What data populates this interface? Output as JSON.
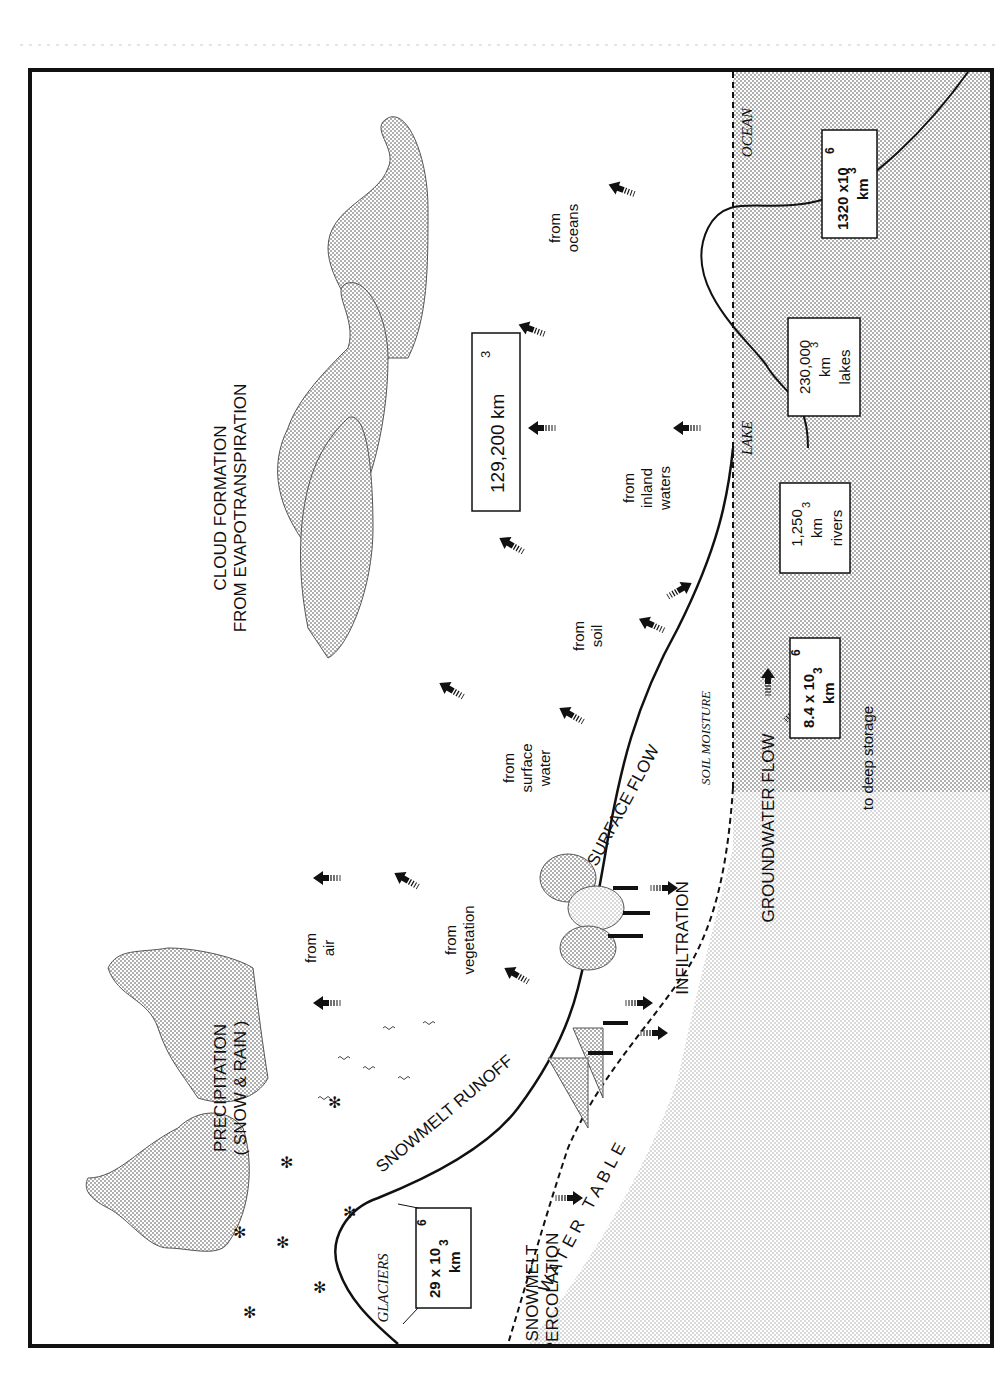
{
  "figure": {
    "title_lines": [
      "CLOUD FORMATION",
      "FROM EVAPOTRANSPIRATION"
    ],
    "precipitation": [
      "PRECIPITATION",
      "( SNOW & RAIN )"
    ],
    "total_box": {
      "value": "129,200 km",
      "sup": "3"
    },
    "sources": [
      {
        "id": "air",
        "lines": [
          "from",
          "air"
        ]
      },
      {
        "id": "vegetation",
        "lines": [
          "from",
          "vegetation"
        ]
      },
      {
        "id": "surface_water",
        "lines": [
          "from",
          "surface",
          "water"
        ]
      },
      {
        "id": "soil",
        "lines": [
          "from",
          "soil"
        ]
      },
      {
        "id": "inland_waters",
        "lines": [
          "from",
          "inland",
          "waters"
        ]
      },
      {
        "id": "oceans",
        "lines": [
          "from",
          "oceans"
        ]
      }
    ],
    "flow_labels": {
      "snowmelt_runoff": "SNOWMELT RUNOFF",
      "surface_flow": "SURFACE FLOW",
      "infiltration": "INFILTRATION",
      "groundwater_flow": "GROUNDWATER FLOW",
      "snowmelt_percolation": [
        "SNOWMELT",
        "PERCOLATION"
      ],
      "water_table": "WATER   TABLE",
      "soil_moisture": "SOIL MOISTURE",
      "to_deep_storage": "to deep storage"
    },
    "region_labels": {
      "glaciers": "GLACIERS",
      "lake": "LAKE",
      "ocean": "OCEAN"
    },
    "storage_boxes": [
      {
        "id": "glaciers",
        "lines": [
          "29 x 10",
          "km"
        ],
        "sups": [
          "6",
          "3"
        ]
      },
      {
        "id": "groundwater",
        "lines": [
          "8.4 x 10",
          "km"
        ],
        "sups": [
          "6",
          "3"
        ]
      },
      {
        "id": "rivers",
        "lines": [
          "1,250",
          "km",
          "rivers"
        ],
        "sups": [
          "",
          "3",
          ""
        ]
      },
      {
        "id": "lakes",
        "lines": [
          "230,000",
          "km",
          "lakes"
        ],
        "sups": [
          "",
          "3",
          ""
        ]
      },
      {
        "id": "ocean",
        "lines": [
          "1320 x10",
          "km"
        ],
        "sups": [
          "6",
          "3"
        ]
      }
    ],
    "colors": {
      "stroke": "#111111",
      "stipple": "#9a9a9a",
      "paper": "#ffffff"
    }
  }
}
